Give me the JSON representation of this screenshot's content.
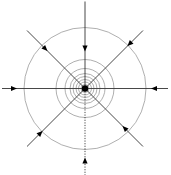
{
  "diagram": {
    "type": "radial-field-sink",
    "center": {
      "x": 85,
      "y": 88.5
    },
    "sink_point_radius": 3.2,
    "circle_radii": [
      4,
      6.5,
      9,
      12,
      15,
      20,
      29,
      61
    ],
    "circle_color": "#9a9a9a",
    "line_color": "#333333",
    "sink_color": "#000000",
    "rays": [
      {
        "id": "top",
        "angle_deg": -90,
        "length": 87,
        "style": "solid",
        "arrow_at": 40,
        "direction": "inward"
      },
      {
        "id": "bottom",
        "angle_deg": 90,
        "length": 87,
        "style": "dotted",
        "arrow_at": 72,
        "direction": "inward"
      },
      {
        "id": "left",
        "angle_deg": 180,
        "length": 83,
        "style": "solid",
        "arrow_at": 71,
        "direction": "inward"
      },
      {
        "id": "right",
        "angle_deg": 0,
        "length": 83,
        "style": "solid",
        "arrow_at": 69,
        "direction": "inward"
      },
      {
        "id": "top-left",
        "angle_deg": -135,
        "length": 82,
        "style": "solid",
        "arrow_at": 56,
        "direction": "inward"
      },
      {
        "id": "top-right",
        "angle_deg": -45,
        "length": 82,
        "style": "solid",
        "arrow_at": 63,
        "direction": "inward"
      },
      {
        "id": "bottom-left",
        "angle_deg": 135,
        "length": 82,
        "style": "solid",
        "arrow_at": 63,
        "direction": "inward"
      },
      {
        "id": "bottom-right",
        "angle_deg": 45,
        "length": 82,
        "style": "solid",
        "arrow_at": 56,
        "direction": "inward"
      }
    ]
  }
}
